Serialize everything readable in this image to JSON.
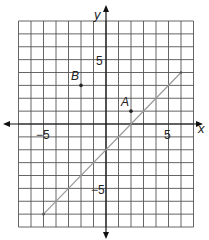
{
  "figure": {
    "type": "coordinate-plane",
    "x_axis_label": "x",
    "y_axis_label": "y",
    "x_range": [
      -7,
      7
    ],
    "y_range": [
      -8,
      8
    ],
    "tick_labels": {
      "x_neg": "−5",
      "x_pos": "5",
      "y_pos": "5",
      "y_neg": "−5"
    },
    "points": [
      {
        "label": "A",
        "x": 2,
        "y": 1
      },
      {
        "label": "B",
        "x": -2,
        "y": 3
      }
    ],
    "line_segment": {
      "from": [
        -5,
        -7
      ],
      "to": [
        6,
        4
      ]
    },
    "colors": {
      "grid": "#555555",
      "axes": "#111111",
      "line": "#999999",
      "point": "#222222"
    }
  },
  "chart_data": {
    "type": "scatter",
    "title": "",
    "xlabel": "x",
    "ylabel": "y",
    "xlim": [
      -7,
      7
    ],
    "ylim": [
      -8,
      8
    ],
    "grid": true,
    "x_ticks_labeled": [
      -5,
      5
    ],
    "y_ticks_labeled": [
      5,
      -5
    ],
    "series": [
      {
        "name": "points",
        "points": [
          {
            "label": "A",
            "x": 2,
            "y": 1
          },
          {
            "label": "B",
            "x": -2,
            "y": 3
          }
        ]
      },
      {
        "name": "line",
        "type": "line",
        "x": [
          -5,
          6
        ],
        "y": [
          -7,
          4
        ]
      }
    ]
  }
}
